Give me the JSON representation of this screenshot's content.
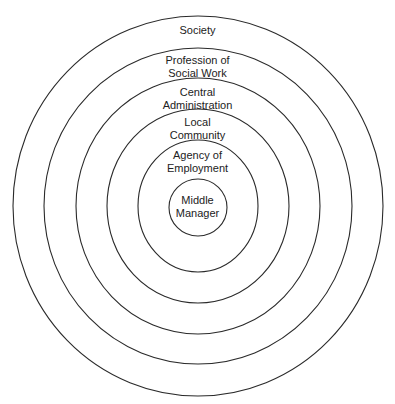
{
  "diagram": {
    "type": "concentric-circles",
    "rings": [
      {
        "id": "society",
        "lines": [
          "Society"
        ]
      },
      {
        "id": "profession",
        "lines": [
          "Profession of",
          "Social Work"
        ]
      },
      {
        "id": "central-admin",
        "lines": [
          "Central",
          "Administration"
        ]
      },
      {
        "id": "local-community",
        "lines": [
          "Local",
          "Community"
        ]
      },
      {
        "id": "agency",
        "lines": [
          "Agency of",
          "Employment"
        ]
      },
      {
        "id": "middle-manager",
        "lines": [
          "Middle",
          "Manager"
        ]
      }
    ],
    "colors": {
      "stroke": "#2a2a2a",
      "text": "#222222",
      "background": "#ffffff"
    }
  }
}
